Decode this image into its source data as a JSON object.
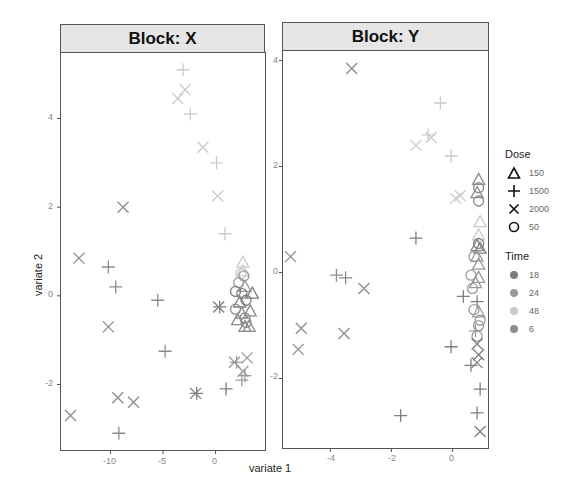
{
  "chart_data": {
    "type": "scatter",
    "xlabel": "variate 1",
    "ylabel": "variate 2",
    "legend": {
      "position": "right",
      "dose": {
        "title": "Dose",
        "entries": [
          {
            "label": "150",
            "shape": "triangle"
          },
          {
            "label": "1500",
            "shape": "plus"
          },
          {
            "label": "2000",
            "shape": "cross"
          },
          {
            "label": "50",
            "shape": "circle"
          }
        ]
      },
      "time": {
        "title": "Time",
        "entries": [
          {
            "label": "18",
            "color": "#7e7e7e"
          },
          {
            "label": "24",
            "color": "#9a9a9a"
          },
          {
            "label": "48",
            "color": "#cacaca"
          },
          {
            "label": "6",
            "color": "#8c8c8c"
          }
        ]
      }
    },
    "panels": [
      {
        "title": "Block: X",
        "xlim": [
          -14.8,
          4.8
        ],
        "ylim": [
          -3.5,
          5.5
        ],
        "xticks": [
          -10,
          -5,
          0
        ],
        "yticks": [
          -2,
          0,
          2,
          4
        ],
        "grid": false,
        "points": [
          {
            "x": -3.1,
            "y": 5.1,
            "dose": "1500",
            "time": "48"
          },
          {
            "x": -2.9,
            "y": 4.65,
            "dose": "2000",
            "time": "48"
          },
          {
            "x": -3.6,
            "y": 4.45,
            "dose": "2000",
            "time": "48"
          },
          {
            "x": -2.4,
            "y": 4.1,
            "dose": "1500",
            "time": "48"
          },
          {
            "x": -1.2,
            "y": 3.35,
            "dose": "2000",
            "time": "48"
          },
          {
            "x": 0.1,
            "y": 3.0,
            "dose": "1500",
            "time": "48"
          },
          {
            "x": 0.2,
            "y": 2.25,
            "dose": "2000",
            "time": "48"
          },
          {
            "x": 0.9,
            "y": 1.4,
            "dose": "1500",
            "time": "48"
          },
          {
            "x": -8.8,
            "y": 2.0,
            "dose": "2000",
            "time": "6"
          },
          {
            "x": -13.0,
            "y": 0.85,
            "dose": "2000",
            "time": "6"
          },
          {
            "x": -10.2,
            "y": 0.65,
            "dose": "1500",
            "time": "6"
          },
          {
            "x": -9.5,
            "y": 0.2,
            "dose": "1500",
            "time": "6"
          },
          {
            "x": -5.5,
            "y": -0.1,
            "dose": "1500",
            "time": "6"
          },
          {
            "x": -10.2,
            "y": -0.7,
            "dose": "2000",
            "time": "6"
          },
          {
            "x": -4.8,
            "y": -1.25,
            "dose": "1500",
            "time": "6"
          },
          {
            "x": -9.3,
            "y": -2.3,
            "dose": "2000",
            "time": "6"
          },
          {
            "x": -7.8,
            "y": -2.4,
            "dose": "2000",
            "time": "6"
          },
          {
            "x": -13.8,
            "y": -2.7,
            "dose": "2000",
            "time": "6"
          },
          {
            "x": -9.2,
            "y": -3.1,
            "dose": "1500",
            "time": "6"
          },
          {
            "x": -1.9,
            "y": -2.2,
            "dose": "2000",
            "time": "18"
          },
          {
            "x": -1.8,
            "y": -2.2,
            "dose": "1500",
            "time": "18"
          },
          {
            "x": 1.0,
            "y": -2.1,
            "dose": "1500",
            "time": "18"
          },
          {
            "x": 0.3,
            "y": -0.25,
            "dose": "2000",
            "time": "18"
          },
          {
            "x": 0.4,
            "y": -0.25,
            "dose": "1500",
            "time": "18"
          },
          {
            "x": 1.8,
            "y": -1.5,
            "dose": "2000",
            "time": "24"
          },
          {
            "x": 2.0,
            "y": -1.5,
            "dose": "1500",
            "time": "24"
          },
          {
            "x": 3.0,
            "y": -1.4,
            "dose": "2000",
            "time": "24"
          },
          {
            "x": 2.6,
            "y": -1.7,
            "dose": "2000",
            "time": "24"
          },
          {
            "x": 2.8,
            "y": -1.8,
            "dose": "1500",
            "time": "24"
          },
          {
            "x": 2.5,
            "y": -1.9,
            "dose": "1500",
            "time": "24"
          },
          {
            "x": 2.6,
            "y": 0.75,
            "dose": "150",
            "time": "48"
          },
          {
            "x": 2.6,
            "y": 0.55,
            "dose": "150",
            "time": "48"
          },
          {
            "x": 2.4,
            "y": 0.5,
            "dose": "50",
            "time": "48"
          },
          {
            "x": 2.7,
            "y": 0.45,
            "dose": "50",
            "time": "24"
          },
          {
            "x": 2.2,
            "y": 0.3,
            "dose": "50",
            "time": "24"
          },
          {
            "x": 2.8,
            "y": 0.2,
            "dose": "150",
            "time": "24"
          },
          {
            "x": 1.9,
            "y": 0.1,
            "dose": "50",
            "time": "18"
          },
          {
            "x": 2.5,
            "y": 0.05,
            "dose": "50",
            "time": "18"
          },
          {
            "x": 3.5,
            "y": 0.05,
            "dose": "150",
            "time": "18"
          },
          {
            "x": 2.3,
            "y": -0.15,
            "dose": "150",
            "time": "18"
          },
          {
            "x": 2.9,
            "y": -0.1,
            "dose": "50",
            "time": "18"
          },
          {
            "x": 1.9,
            "y": -0.3,
            "dose": "50",
            "time": "6"
          },
          {
            "x": 2.5,
            "y": -0.4,
            "dose": "150",
            "time": "6"
          },
          {
            "x": 3.3,
            "y": -0.35,
            "dose": "150",
            "time": "6"
          },
          {
            "x": 2.8,
            "y": -0.5,
            "dose": "50",
            "time": "6"
          },
          {
            "x": 2.1,
            "y": -0.55,
            "dose": "150",
            "time": "6"
          },
          {
            "x": 2.8,
            "y": -0.7,
            "dose": "150",
            "time": "6"
          },
          {
            "x": 3.2,
            "y": -0.7,
            "dose": "150",
            "time": "6"
          },
          {
            "x": 2.9,
            "y": -0.6,
            "dose": "50",
            "time": "6"
          }
        ]
      },
      {
        "title": "Block: Y",
        "xlim": [
          -5.58,
          1.19
        ],
        "ylim": [
          -3.33,
          4.2
        ],
        "xticks": [
          -4,
          -2,
          0
        ],
        "yticks": [
          -2,
          0,
          2,
          4
        ],
        "grid": false,
        "points": [
          {
            "x": -3.3,
            "y": 3.85,
            "dose": "2000",
            "time": "6"
          },
          {
            "x": -0.4,
            "y": 3.2,
            "dose": "1500",
            "time": "48"
          },
          {
            "x": -0.8,
            "y": 2.6,
            "dose": "1500",
            "time": "48"
          },
          {
            "x": -0.7,
            "y": 2.55,
            "dose": "2000",
            "time": "48"
          },
          {
            "x": -1.2,
            "y": 2.4,
            "dose": "2000",
            "time": "48"
          },
          {
            "x": -0.05,
            "y": 2.2,
            "dose": "1500",
            "time": "48"
          },
          {
            "x": 0.1,
            "y": 1.4,
            "dose": "2000",
            "time": "48"
          },
          {
            "x": 0.25,
            "y": 1.45,
            "dose": "2000",
            "time": "48"
          },
          {
            "x": 0.85,
            "y": 1.75,
            "dose": "150",
            "time": "6"
          },
          {
            "x": 0.85,
            "y": 1.6,
            "dose": "50",
            "time": "6"
          },
          {
            "x": 0.8,
            "y": 1.5,
            "dose": "150",
            "time": "6"
          },
          {
            "x": 0.85,
            "y": 1.35,
            "dose": "50",
            "time": "6"
          },
          {
            "x": 0.9,
            "y": 0.95,
            "dose": "150",
            "time": "48"
          },
          {
            "x": 0.85,
            "y": 0.7,
            "dose": "150",
            "time": "48"
          },
          {
            "x": -1.2,
            "y": 0.65,
            "dose": "1500",
            "time": "18"
          },
          {
            "x": 0.85,
            "y": 0.55,
            "dose": "50",
            "time": "18"
          },
          {
            "x": 0.8,
            "y": 0.5,
            "dose": "150",
            "time": "18"
          },
          {
            "x": 0.9,
            "y": 0.45,
            "dose": "150",
            "time": "18"
          },
          {
            "x": 0.8,
            "y": 0.3,
            "dose": "150",
            "time": "24"
          },
          {
            "x": 0.7,
            "y": 0.3,
            "dose": "50",
            "time": "24"
          },
          {
            "x": 0.85,
            "y": 0.15,
            "dose": "150",
            "time": "24"
          },
          {
            "x": 0.6,
            "y": -0.05,
            "dose": "50",
            "time": "24"
          },
          {
            "x": 0.85,
            "y": -0.1,
            "dose": "150",
            "time": "24"
          },
          {
            "x": 0.75,
            "y": -0.2,
            "dose": "150",
            "time": "24"
          },
          {
            "x": 0.65,
            "y": -0.3,
            "dose": "50",
            "time": "24"
          },
          {
            "x": 0.35,
            "y": -0.45,
            "dose": "1500",
            "time": "18"
          },
          {
            "x": 0.8,
            "y": -0.55,
            "dose": "1500",
            "time": "18"
          },
          {
            "x": 0.7,
            "y": -0.7,
            "dose": "50",
            "time": "24"
          },
          {
            "x": 0.85,
            "y": -0.75,
            "dose": "150",
            "time": "24"
          },
          {
            "x": 0.9,
            "y": -0.9,
            "dose": "50",
            "time": "24"
          },
          {
            "x": 0.85,
            "y": -1.0,
            "dose": "50",
            "time": "24"
          },
          {
            "x": 0.75,
            "y": -1.1,
            "dose": "1500",
            "time": "24"
          },
          {
            "x": 0.8,
            "y": -1.2,
            "dose": "50",
            "time": "24"
          },
          {
            "x": 0.8,
            "y": -1.35,
            "dose": "2000",
            "time": "18"
          },
          {
            "x": -0.05,
            "y": -1.4,
            "dose": "1500",
            "time": "18"
          },
          {
            "x": 0.85,
            "y": -1.55,
            "dose": "2000",
            "time": "18"
          },
          {
            "x": 0.8,
            "y": -1.7,
            "dose": "2000",
            "time": "18"
          },
          {
            "x": 0.6,
            "y": -1.75,
            "dose": "1500",
            "time": "18"
          },
          {
            "x": 0.9,
            "y": -2.2,
            "dose": "1500",
            "time": "18"
          },
          {
            "x": 0.8,
            "y": -2.65,
            "dose": "1500",
            "time": "18"
          },
          {
            "x": 0.9,
            "y": -3.0,
            "dose": "2000",
            "time": "18"
          },
          {
            "x": -1.7,
            "y": -2.7,
            "dose": "1500",
            "time": "18"
          },
          {
            "x": -5.3,
            "y": 0.3,
            "dose": "2000",
            "time": "6"
          },
          {
            "x": -3.8,
            "y": -0.05,
            "dose": "1500",
            "time": "6"
          },
          {
            "x": -3.5,
            "y": -0.1,
            "dose": "1500",
            "time": "6"
          },
          {
            "x": -2.9,
            "y": -0.3,
            "dose": "2000",
            "time": "6"
          },
          {
            "x": -4.95,
            "y": -1.05,
            "dose": "2000",
            "time": "6"
          },
          {
            "x": -3.55,
            "y": -1.15,
            "dose": "2000",
            "time": "6"
          },
          {
            "x": -5.05,
            "y": -1.45,
            "dose": "2000",
            "time": "6"
          }
        ]
      }
    ]
  },
  "axes": {
    "xlabel": "variate 1",
    "ylabel": "variate 2"
  },
  "panels": [
    {
      "title": "Block: X",
      "xticks": [
        "-10",
        "-5",
        "0"
      ],
      "yticks": [
        "4",
        "2",
        "0",
        "-2"
      ]
    },
    {
      "title": "Block: Y",
      "xticks": [
        "-4",
        "-2",
        "0"
      ],
      "yticks": [
        "4",
        "2",
        "0",
        "-2"
      ]
    }
  ],
  "legend": {
    "dose_title": "Dose",
    "dose": [
      {
        "label": "150",
        "icon": "triangle-icon"
      },
      {
        "label": "1500",
        "icon": "plus-icon"
      },
      {
        "label": "2000",
        "icon": "cross-icon"
      },
      {
        "label": "50",
        "icon": "circle-icon"
      }
    ],
    "time_title": "Time",
    "time": [
      {
        "label": "18",
        "color": "#7e7e7e"
      },
      {
        "label": "24",
        "color": "#9a9a9a"
      },
      {
        "label": "48",
        "color": "#cacaca"
      },
      {
        "label": "6",
        "color": "#8c8c8c"
      }
    ]
  }
}
